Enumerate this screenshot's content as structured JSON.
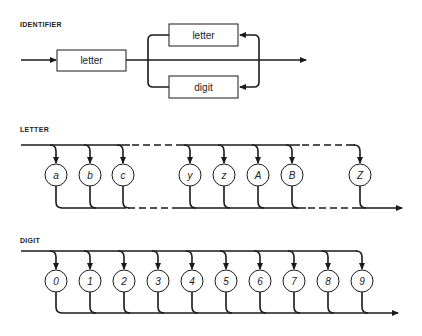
{
  "identifier": {
    "title": "IDENTIFIER",
    "first_box": "letter",
    "loop_boxes": [
      "letter",
      "digit"
    ]
  },
  "letter": {
    "title": "LETTER",
    "terminals": [
      "a",
      "b",
      "c",
      "y",
      "z",
      "A",
      "B",
      "Z"
    ],
    "x_positions": [
      56,
      90,
      123,
      190,
      224,
      258,
      292,
      360
    ],
    "gaps_after_index": [
      2,
      6
    ]
  },
  "digit": {
    "title": "DIGIT",
    "terminals": [
      "0",
      "1",
      "2",
      "3",
      "4",
      "5",
      "6",
      "7",
      "8",
      "9"
    ],
    "x_positions": [
      56,
      90,
      124,
      158,
      192,
      226,
      260,
      294,
      328,
      362
    ]
  },
  "colors": {
    "line": "#1a1a1a",
    "background": "#ffffff"
  }
}
